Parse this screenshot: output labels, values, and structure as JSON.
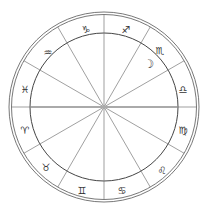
{
  "chart": {
    "center": [
      104,
      107
    ],
    "outer_radius": 95,
    "outer_inner_ring_radius": 93,
    "inner_radius": 74,
    "colors": {
      "ring": "#444444",
      "spoke": "#777777",
      "axis": "#aaaaaa",
      "glyph": "#333333",
      "background": "#ffffff"
    },
    "signs": [
      {
        "name": "aries",
        "glyph": "♈",
        "x": 25,
        "y": 131
      },
      {
        "name": "taurus",
        "glyph": "♉",
        "x": 46,
        "y": 168
      },
      {
        "name": "gemini",
        "glyph": "♊",
        "x": 82,
        "y": 191
      },
      {
        "name": "cancer",
        "glyph": "♋",
        "x": 122,
        "y": 191
      },
      {
        "name": "leo",
        "glyph": "♌",
        "x": 162,
        "y": 171
      },
      {
        "name": "virgo",
        "glyph": "♍",
        "x": 183,
        "y": 131
      },
      {
        "name": "libra",
        "glyph": "♎",
        "x": 183,
        "y": 90
      },
      {
        "name": "scorpio",
        "glyph": "♏",
        "x": 160,
        "y": 51
      },
      {
        "name": "sagittarius",
        "glyph": "♐",
        "x": 126,
        "y": 30
      },
      {
        "name": "capricorn",
        "glyph": "♑",
        "x": 86,
        "y": 30
      },
      {
        "name": "aquarius",
        "glyph": "♒",
        "x": 48,
        "y": 53
      },
      {
        "name": "pisces",
        "glyph": "♓",
        "x": 25,
        "y": 90
      }
    ],
    "planets": [
      {
        "name": "moon",
        "glyph": "☽",
        "x": 149,
        "y": 64
      }
    ]
  }
}
